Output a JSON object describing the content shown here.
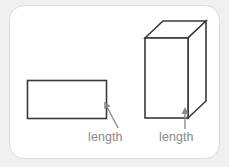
{
  "figure": {
    "background_color": "#f0f0f0",
    "card": {
      "fill_color": "#ffffff",
      "border_color": "#dcdcdc",
      "corner_radius": 15
    },
    "stroke_color": "#3a3a3a",
    "label_color": "#8a8a8a",
    "labels": {
      "rectangle_length": "length",
      "prism_length": "length"
    },
    "shapes": [
      {
        "name": "rectangle",
        "type": "rectangle-2d",
        "x": 27,
        "y": 80,
        "width": 80,
        "height": 39
      },
      {
        "name": "rectangular-prism",
        "type": "cuboid-3d",
        "front_face": {
          "x": 145,
          "y": 38,
          "width": 43,
          "height": 80
        },
        "depth_offset_x": 18,
        "depth_offset_y": -17
      }
    ],
    "annotations": [
      {
        "name": "rectangle-length-arrow",
        "from_x": 118,
        "from_y": 128,
        "to_x": 105,
        "to_y": 104,
        "points_to": "rectangle-bottom-right-edge"
      },
      {
        "name": "prism-length-arrow",
        "from_x": 185,
        "from_y": 129,
        "to_x": 185,
        "to_y": 110,
        "points_to": "prism-bottom-front-right-edge"
      }
    ]
  }
}
